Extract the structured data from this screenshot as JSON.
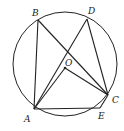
{
  "diagram": {
    "circle": {
      "cx": 65,
      "cy": 64,
      "r": 52
    },
    "points": {
      "A": {
        "x": 34,
        "y": 109,
        "label": "A",
        "lx": 24,
        "ly": 122
      },
      "B": {
        "x": 38,
        "y": 20,
        "label": "B",
        "lx": 32,
        "ly": 16
      },
      "D": {
        "x": 87,
        "y": 19,
        "label": "D",
        "lx": 88,
        "ly": 14
      },
      "O": {
        "x": 65,
        "y": 68,
        "label": "O",
        "lx": 65,
        "ly": 66
      },
      "C": {
        "x": 108,
        "y": 95,
        "label": "C",
        "lx": 112,
        "ly": 103
      },
      "E": {
        "x": 100,
        "y": 108,
        "label": "E",
        "lx": 98,
        "ly": 119
      }
    },
    "segments": [
      [
        "B",
        "A"
      ],
      [
        "B",
        "C"
      ],
      [
        "D",
        "A"
      ],
      [
        "D",
        "C"
      ],
      [
        "A",
        "E"
      ],
      [
        "E",
        "C"
      ],
      [
        "O",
        "A"
      ],
      [
        "O",
        "C"
      ]
    ]
  }
}
